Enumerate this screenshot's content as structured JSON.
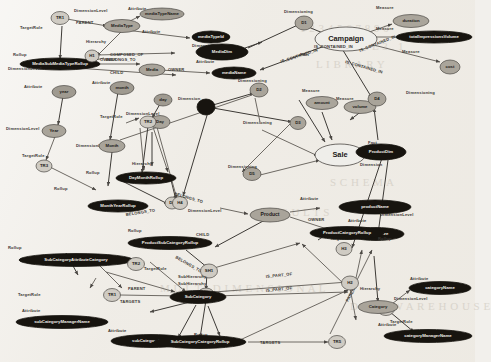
{
  "diagram": {
    "type": "labeled-property-graph",
    "background_color": "#efece6",
    "node_styles": {
      "fact": "#efeeea",
      "dimension": "#17140f",
      "dimension_level": "#a9a49a",
      "attribute": "#9f9a90",
      "measure": "#aaa59b",
      "hierarchy": "#cfcbc3",
      "rollup": "#cfcbc3"
    },
    "role_labels": {
      "fact": "Fact",
      "dimension": "Dimension",
      "dimensioning": "Dimensioning",
      "dimension_level": "DimensionLevel",
      "attribute": "Attribute",
      "measure": "Measure",
      "hierarchy": "Hierarchy",
      "subhierarchy": "SubHierarchy",
      "rollup": "Rollup",
      "targetrole": "TargetRole",
      "parent": "PARENT",
      "child": "CHILD",
      "owner": "OWNER",
      "belongs_to": "BELONGS_TO",
      "composed_of": "COMPOSED_OF",
      "is_contained_in": "IS_CONTAINED_IN",
      "is_part_of": "IS_PART_OF",
      "targets": "TARGETS"
    },
    "nodes": [
      {
        "id": "TR1a",
        "label": "TR1",
        "kind": "rollup"
      },
      {
        "id": "MediaSubMediaTypeR",
        "label": "MediaSubMediaTypeRollup",
        "kind": "rollup_target"
      },
      {
        "id": "MediaType",
        "label": "MediaType",
        "kind": "level"
      },
      {
        "id": "mediaTypeName",
        "label": "mediaTypeName",
        "kind": "attribute"
      },
      {
        "id": "mediaTypeId",
        "label": "mediaTypeId",
        "kind": "attribute"
      },
      {
        "id": "H1",
        "label": "H1",
        "kind": "hierarchy"
      },
      {
        "id": "MediaDim",
        "label": "MediaDim",
        "kind": "dimension"
      },
      {
        "id": "Media",
        "label": "Media",
        "kind": "level"
      },
      {
        "id": "mediaName",
        "label": "mediaName",
        "kind": "attribute"
      },
      {
        "id": "D1",
        "label": "D1",
        "kind": "dimensioning"
      },
      {
        "id": "Campaign",
        "label": "Campaign",
        "kind": "fact"
      },
      {
        "id": "duration",
        "label": "duration",
        "kind": "measure"
      },
      {
        "id": "totalImpressionsVolume",
        "label": "totalImpressionsVolume",
        "kind": "measure"
      },
      {
        "id": "cost",
        "label": "cost",
        "kind": "measure"
      },
      {
        "id": "amount",
        "label": "amount",
        "kind": "measure"
      },
      {
        "id": "volume",
        "label": "volume",
        "kind": "measure"
      },
      {
        "id": "D2",
        "label": "D2",
        "kind": "dimensioning"
      },
      {
        "id": "D3",
        "label": "D3",
        "kind": "dimensioning"
      },
      {
        "id": "D4",
        "label": "D4",
        "kind": "dimensioning"
      },
      {
        "id": "D5",
        "label": "D5",
        "kind": "dimensioning"
      },
      {
        "id": "D6",
        "label": "D6",
        "kind": "dimensioning"
      },
      {
        "id": "TimeDim",
        "label": "TimeDim",
        "kind": "dimension"
      },
      {
        "id": "Sale",
        "label": "Sale",
        "kind": "fact"
      },
      {
        "id": "ProductDim",
        "label": "ProductDim",
        "kind": "dimension"
      },
      {
        "id": "year",
        "label": "year",
        "kind": "attribute"
      },
      {
        "id": "Year",
        "label": "Year",
        "kind": "level"
      },
      {
        "id": "month",
        "label": "month",
        "kind": "attribute"
      },
      {
        "id": "Month",
        "label": "Month",
        "kind": "level"
      },
      {
        "id": "Day",
        "label": "Day",
        "kind": "level"
      },
      {
        "id": "day",
        "label": "day",
        "kind": "attribute"
      },
      {
        "id": "TR2",
        "label": "TR2",
        "kind": "rollup"
      },
      {
        "id": "TR3",
        "label": "TR3",
        "kind": "rollup"
      },
      {
        "id": "DayMonthRollup",
        "label": "DayMonthRollup",
        "kind": "rollup_target"
      },
      {
        "id": "MonthYearRollup",
        "label": "MonthYearRollup",
        "kind": "rollup_target"
      },
      {
        "id": "H4",
        "label": "H4",
        "kind": "hierarchy"
      },
      {
        "id": "Product",
        "label": "Product",
        "kind": "level"
      },
      {
        "id": "productName",
        "label": "productName",
        "kind": "attribute"
      },
      {
        "id": "productSize",
        "label": "productSize",
        "kind": "attribute"
      },
      {
        "id": "ProductSubCategoryRollup",
        "label": "ProductSubCategoryRollup",
        "kind": "rollup_target"
      },
      {
        "id": "SH1",
        "label": "SH1",
        "kind": "subhierarchy"
      },
      {
        "id": "SH2",
        "label": "SH2",
        "kind": "subhierarchy"
      },
      {
        "id": "SubCategory",
        "label": "SubCategory",
        "kind": "level"
      },
      {
        "id": "subCategoryName",
        "label": "subCategoryName",
        "kind": "attribute"
      },
      {
        "id": "subCategoryManagerName",
        "label": "subCategoryManagerName",
        "kind": "attribute"
      },
      {
        "id": "SubCategoryAttributeCategory",
        "label": "SubCategoryAttributeCategory",
        "kind": "rollup_target"
      },
      {
        "id": "SubCategoryCategoryRollup",
        "label": "SubCategoryCategoryRollup",
        "kind": "rollup_target"
      },
      {
        "id": "TR1b",
        "label": "TR1",
        "kind": "rollup"
      },
      {
        "id": "TR2b",
        "label": "TR2",
        "kind": "rollup"
      },
      {
        "id": "TR5",
        "label": "TR5",
        "kind": "rollup"
      },
      {
        "id": "TR4",
        "label": "TR4",
        "kind": "rollup"
      },
      {
        "id": "H2",
        "label": "H2",
        "kind": "hierarchy"
      },
      {
        "id": "H3",
        "label": "H3",
        "kind": "hierarchy"
      },
      {
        "id": "ProductCategoryRollup",
        "label": "ProductCategoryRollup",
        "kind": "rollup_target"
      },
      {
        "id": "Category",
        "label": "Category",
        "kind": "level"
      },
      {
        "id": "categoryName",
        "label": "categoryName",
        "kind": "attribute"
      },
      {
        "id": "categoryManagerName",
        "label": "categoryManagerName",
        "kind": "attribute"
      }
    ],
    "edges": [
      {
        "from": "TR1a",
        "to": "MediaType",
        "label": "PARENT"
      },
      {
        "from": "TR1a",
        "to": "MediaSubMediaTypeR",
        "label": "TargetRole"
      },
      {
        "from": "MediaSubMediaTypeR",
        "to": "Media",
        "label": "CHILD"
      },
      {
        "from": "MediaSubMediaTypeR",
        "to": "H1",
        "label": "BELONGS_TO"
      },
      {
        "from": "MediaType",
        "to": "mediaTypeName",
        "label": "Attribute"
      },
      {
        "from": "MediaType",
        "to": "mediaTypeId",
        "label": "Attribute"
      },
      {
        "from": "MediaType",
        "to": "H1",
        "label": "OWNER"
      },
      {
        "from": "H1",
        "to": "MediaDim",
        "label": "COMPOSED_OF"
      },
      {
        "from": "Media",
        "to": "mediaName",
        "label": "Attribute"
      },
      {
        "from": "Media",
        "to": "H1",
        "label": "OWNER"
      },
      {
        "from": "MediaDim",
        "to": "D1",
        "label": "Dimension"
      },
      {
        "from": "D1",
        "to": "Campaign",
        "label": "Dimensioning"
      },
      {
        "from": "Campaign",
        "to": "duration",
        "label": "IS_CONTAINED_IN"
      },
      {
        "from": "Campaign",
        "to": "totalImpressionsVolume",
        "label": "IS_CONTAINED_IN"
      },
      {
        "from": "Campaign",
        "to": "cost",
        "label": "IS_CONTAINED_IN"
      },
      {
        "from": "Campaign",
        "to": "D2",
        "label": "IS_CONTAINED_IN"
      },
      {
        "from": "Campaign",
        "to": "D4",
        "label": "IS_CONTAINED_IN"
      },
      {
        "from": "TimeDim",
        "to": "D2",
        "label": "Dimensioning"
      },
      {
        "from": "TimeDim",
        "to": "D3",
        "label": "Dimensioning"
      },
      {
        "from": "TimeDim",
        "to": "D5",
        "label": "Dimension"
      },
      {
        "from": "Sale",
        "to": "amount",
        "label": "Measure"
      },
      {
        "from": "Sale",
        "to": "volume",
        "label": "Measure"
      },
      {
        "from": "Sale",
        "to": "D5",
        "label": "Dimensioning"
      },
      {
        "from": "Sale",
        "to": "ProductDim",
        "label": "Dimension"
      },
      {
        "from": "D4",
        "to": "ProductDim",
        "label": "Dimensioning"
      },
      {
        "from": "Year",
        "to": "year",
        "label": "Attribute"
      },
      {
        "from": "Month",
        "to": "month",
        "label": "Attribute"
      },
      {
        "from": "Day",
        "to": "day",
        "label": "Attribute"
      },
      {
        "from": "TR2",
        "to": "Month",
        "label": "TargetRole"
      },
      {
        "from": "TR3",
        "to": "Day",
        "label": "TargetRole"
      },
      {
        "from": "DayMonthRollup",
        "to": "H4",
        "label": "BELONGS_TO"
      },
      {
        "from": "MonthYearRollup",
        "to": "H4",
        "label": "BELONGS_TO"
      },
      {
        "from": "MonthYearRollup",
        "to": "Year",
        "label": "Rollup"
      },
      {
        "from": "DayMonthRollup",
        "to": "Day",
        "label": "Rollup"
      },
      {
        "from": "H4",
        "to": "Month",
        "label": "Hierarchy"
      },
      {
        "from": "Product",
        "to": "productName",
        "label": "Attribute"
      },
      {
        "from": "Product",
        "to": "productSize",
        "label": "Attribute"
      },
      {
        "from": "Product",
        "to": "H2",
        "label": "OWNER"
      },
      {
        "from": "ProductSubCategoryRollup",
        "to": "Product",
        "label": "CHILD"
      },
      {
        "from": "ProductSubCategoryRollup",
        "to": "SH1",
        "label": "BELONGS_TO"
      },
      {
        "from": "SubCategory",
        "to": "subCategoryName",
        "label": "Attribute"
      },
      {
        "from": "SubCategory",
        "to": "subCategoryManagerName",
        "label": "Attribute"
      },
      {
        "from": "SubCategory",
        "to": "TR1b",
        "label": "PARENT"
      },
      {
        "from": "SubCategoryAttributeCategory",
        "to": "TR1b",
        "label": "TargetRole"
      },
      {
        "from": "SubCategoryAttributeCategory",
        "to": "SubCategory",
        "label": "Rollup"
      },
      {
        "from": "SH1",
        "to": "SH2",
        "label": "SubHierarchy"
      },
      {
        "from": "SH1",
        "to": "H2",
        "label": "IS_PART_OF"
      },
      {
        "from": "SH2",
        "to": "H3",
        "label": "IS_PART_OF"
      },
      {
        "from": "SubCategoryCategoryRollup",
        "to": "SH2",
        "label": "BELONGS_TO"
      },
      {
        "from": "SubCategoryCategoryRollup",
        "to": "TR5",
        "label": "TARGETS"
      },
      {
        "from": "ProductCategoryRollup",
        "to": "TR4",
        "label": "TARGETS"
      },
      {
        "from": "Category",
        "to": "categoryName",
        "label": "Attribute"
      },
      {
        "from": "Category",
        "to": "categoryManagerName",
        "label": "Attribute"
      },
      {
        "from": "Category",
        "to": "TR4",
        "label": "PARENT"
      },
      {
        "from": "Category",
        "to": "H3",
        "label": "Hierarchy"
      }
    ],
    "ghost_text": [
      "1 2 3 4 5 6 7 8 9 0",
      "L I B R A R Y",
      "D A T A  W A R E H O U S E",
      "T A B L E  3 . 1",
      "M U L T I D I M E N S I O N A L",
      "R E S U L T S",
      "S C H E M A"
    ]
  }
}
